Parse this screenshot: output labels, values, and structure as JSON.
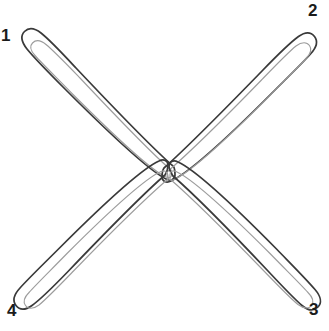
{
  "figure": {
    "canvas": {
      "width": 329,
      "height": 331,
      "background_color": "#ffffff"
    },
    "style": {
      "outer_stroke_color": "#3a3a3a",
      "inner_stroke_color": "#9d9d9d",
      "outer_stroke_width": 1.7,
      "inner_stroke_width": 1.15,
      "label_color": "#1b1b1b",
      "label_font_size": 17
    },
    "center": {
      "x": 168,
      "y": 172
    },
    "arms": [
      {
        "id": "arm-1",
        "label": "1",
        "direction": "top-left",
        "tip": {
          "x": 30,
          "y": 32
        },
        "label_position": {
          "x": 1,
          "y": 27
        },
        "arm_width": 20
      },
      {
        "id": "arm-2",
        "label": "2",
        "direction": "top-right",
        "tip": {
          "x": 302,
          "y": 28
        },
        "label_position": {
          "x": 308,
          "y": 2
        },
        "arm_width": 21
      },
      {
        "id": "arm-3",
        "label": "3",
        "direction": "bottom-right",
        "tip": {
          "x": 300,
          "y": 304
        },
        "label_position": {
          "x": 309,
          "y": 301
        },
        "arm_width": 21
      },
      {
        "id": "arm-4",
        "label": "4",
        "direction": "bottom-left",
        "tip": {
          "x": 32,
          "y": 308
        },
        "label_position": {
          "x": 7,
          "y": 302
        },
        "arm_width": 20
      }
    ],
    "paths": {
      "arm_a_outer": "M 173.5 166.5 C 150 146 110 104 76 68 C 62 53 50 40 41 33 C 34 27.5 28.5 27.5 24.5 31.5 C 20.5 35.5 21.5 42 27 49 C 35 59 49 73 66 90 C 104 128 148 170 166 179 C 171 181.5 175 179 175 175 C 175 171.5 174.5 168 173.5 166.5 Z",
      "arm_a_inner": "M 171 170 C 149 151 112 112 80 78 C 66 63.5 54 51 46 44.5 C 40.5 40 35.5 40 32.5 43 C 29.5 46 30.5 50.5 35 55.5 C 43 64.5 57 78 73 94.5 C 109 130.5 150 170 166 177 C 169.5 178.5 172 177 172 174 C 172 172 171.5 170.8 171 170 Z",
      "arm_b_outer": "M 164 168 C 187 147.5 228 106 262.5 70.5 C 277 55.5 289.5 43 298.5 36.5 C 305.5 31.5 311 32 314.5 36.5 C 318 41 316.5 47.5 310.5 54 C 302 63.5 288 77 271 94 C 233.5 131.5 189 173 171 181 C 166 183.5 162 181 162 177 C 162 173.5 163 169.5 164 168 Z",
      "arm_b_inner": "M 167 172 C 189 153 229 113.5 261.5 80 C 276 65 288 52.5 296 46 C 302 41.5 307 42 309.5 45.5 C 312 49 311 53.5 306 58.5 C 298 67.5 284 81 268 97.5 C 232 133.5 190 172.5 174 179.5 C 170.5 181 168 179.5 168 176.5 C 168 174.5 167 172.8 167 172 Z",
      "arm_c_outer": "M 173 176 C 196 196 235 236 268 271 C 282 286 294 298.5 302 305.5 C 308.5 311 314 311 318 307 C 322 303 321 296.5 315 289.5 C 307 280 293.5 266.5 277 249.5 C 240 212 196 170 178 162 C 173 159.5 169 162 169 166 C 169 169.5 172 174.5 173 176 Z",
      "arm_c_inner": "M 170 179 C 192 198 231 237 263.5 270.5 C 278 285.5 290 298 298 304.5 C 304 309 309 309 311.5 305.5 C 314 302 313 297.5 308 292.5 C 300 283.5 286 270 270 253.5 C 234 217.5 192 178.5 176 171.5 C 172.5 170 170 171.5 170 174.5 C 170 176.5 170 178.2 170 179 Z",
      "arm_d_outer": "M 165 175 C 142 195 102 236 68 271.5 C 53.5 286.5 41 299 32 305.5 C 25 310.5 19.5 310 16 305.5 C 12.5 301 14 294.5 20 288 C 28.5 278.5 42.5 265 59.5 248 C 97 210.5 141 169 159 161 C 164 158.5 168 161 168 165 C 168 168.5 166 173.5 165 175 Z",
      "arm_d_inner": "M 168 179 C 146 198 106 237.5 73.5 271 C 59 286 47 298.5 39 305 C 33 309.5 28 309 25.5 305.5 C 23 302 24 297.5 29 292.5 C 37 283.5 51 270 67 253.5 C 103 217.5 145 178.5 161 171.5 C 164.5 170 167 171.5 167 174.5 C 167 176.5 168 178.2 168 179 Z"
    }
  }
}
